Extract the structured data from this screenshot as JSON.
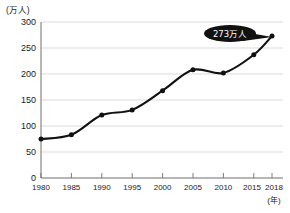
{
  "chart_data": {
    "type": "line",
    "title": "",
    "xlabel": "(年)",
    "ylabel": "(万人)",
    "categories": [
      "1980",
      "1985",
      "1990",
      "1995",
      "2000",
      "2005",
      "2010",
      "2015",
      "2018"
    ],
    "x": [
      1980,
      1985,
      1990,
      1995,
      2000,
      2005,
      2010,
      2015,
      2018
    ],
    "values": [
      75,
      83,
      121,
      131,
      168,
      208,
      202,
      237,
      273
    ],
    "xlim": [
      1980,
      2018
    ],
    "ylim": [
      0,
      300
    ],
    "yticks": [
      "0",
      "50",
      "100",
      "150",
      "200",
      "250",
      "300"
    ],
    "ytick_values": [
      0,
      50,
      100,
      150,
      200,
      250,
      300
    ],
    "grid": true,
    "legend": "none",
    "series_color": "#111111",
    "grid_color": "#d2d2d2",
    "axis_color": "#6f6f6f",
    "annotations": [
      {
        "label": "273万人",
        "target_x": 2018,
        "target_y": 273,
        "style": "black-ellipse-callout",
        "text_color": "#ffffff",
        "fill_color": "#111111"
      }
    ]
  },
  "axes": {
    "y_unit_label": "(万人)",
    "x_unit_label": "(年)"
  }
}
